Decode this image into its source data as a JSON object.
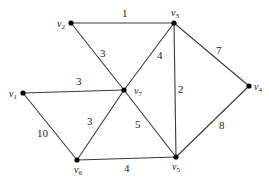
{
  "diagram": {
    "type": "weighted-undirected-graph",
    "nodes": [
      {
        "id": "v1",
        "label": "v",
        "sub": "1",
        "x": 23,
        "y": 93,
        "lx": 9,
        "ly": 97
      },
      {
        "id": "v2",
        "label": "v",
        "sub": "2",
        "x": 71,
        "y": 23,
        "lx": 57,
        "ly": 27
      },
      {
        "id": "v3",
        "label": "v",
        "sub": "3",
        "x": 174,
        "y": 23,
        "lx": 171,
        "ly": 16
      },
      {
        "id": "v4",
        "label": "v",
        "sub": "4",
        "x": 249,
        "y": 86,
        "lx": 254,
        "ly": 90
      },
      {
        "id": "v5",
        "label": "v",
        "sub": "5",
        "x": 176,
        "y": 157,
        "lx": 172,
        "ly": 170
      },
      {
        "id": "v6",
        "label": "v",
        "sub": "6",
        "x": 77,
        "y": 160,
        "lx": 74,
        "ly": 173
      },
      {
        "id": "v7",
        "label": "v",
        "sub": "7",
        "x": 124,
        "y": 90,
        "lx": 134,
        "ly": 94
      }
    ],
    "edges": [
      {
        "from": "v2",
        "to": "v3",
        "weight": "1",
        "lx": 122,
        "ly": 17
      },
      {
        "from": "v2",
        "to": "v7",
        "weight": "3",
        "lx": 100,
        "ly": 57
      },
      {
        "from": "v3",
        "to": "v7",
        "weight": "4",
        "lx": 157,
        "ly": 59
      },
      {
        "from": "v3",
        "to": "v5",
        "weight": "2",
        "lx": 178,
        "ly": 93
      },
      {
        "from": "v3",
        "to": "v4",
        "weight": "7",
        "lx": 216,
        "ly": 54
      },
      {
        "from": "v1",
        "to": "v7",
        "weight": "3",
        "lx": 76,
        "ly": 85
      },
      {
        "from": "v1",
        "to": "v6",
        "weight": "10",
        "lx": 37,
        "ly": 137
      },
      {
        "from": "v6",
        "to": "v7",
        "weight": "3",
        "lx": 87,
        "ly": 125
      },
      {
        "from": "v7",
        "to": "v5",
        "weight": "5",
        "lx": 135,
        "ly": 128
      },
      {
        "from": "v6",
        "to": "v5",
        "weight": "4",
        "lx": 124,
        "ly": 172
      },
      {
        "from": "v4",
        "to": "v5",
        "weight": "8",
        "lx": 219,
        "ly": 129
      }
    ]
  }
}
